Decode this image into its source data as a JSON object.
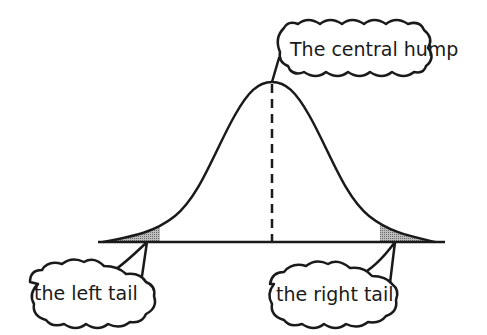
{
  "diagram": {
    "type": "normal-distribution-annotated",
    "colors": {
      "stroke": "#1a1a1a",
      "tail_fill": "#9a9a9a",
      "background": "#ffffff"
    },
    "callouts": {
      "center": "The central hump",
      "left": "the left tail",
      "right": "the right tail"
    }
  }
}
